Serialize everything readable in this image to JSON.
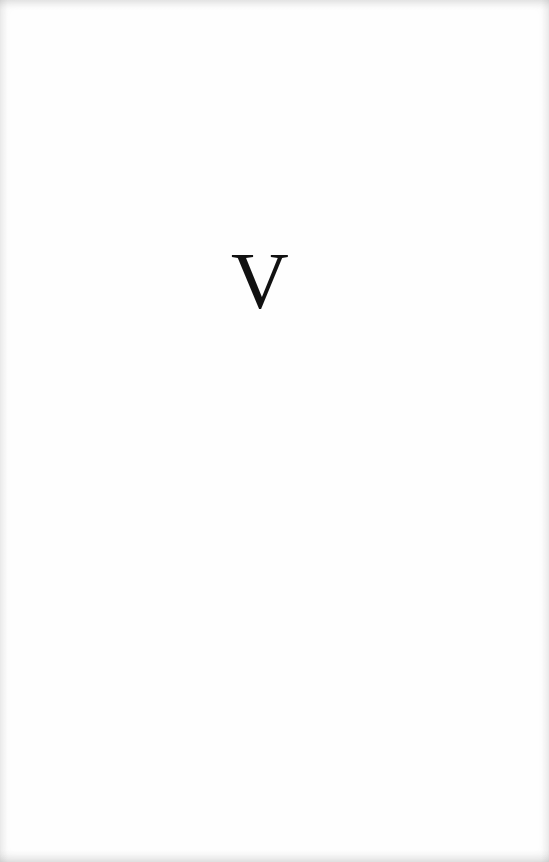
{
  "page": {
    "chapter_numeral": "V",
    "text_color": "#111111",
    "background_color": "#fefefe"
  }
}
